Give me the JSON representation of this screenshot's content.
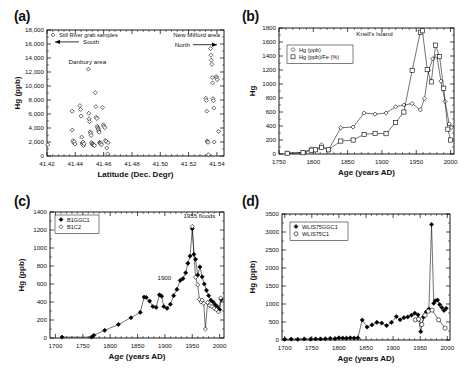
{
  "figure": {
    "panels": [
      "(a)",
      "(b)",
      "(c)",
      "(d)"
    ]
  },
  "chart_data": [
    {
      "panel": "(a)",
      "type": "scatter",
      "title": "",
      "xlabel": "Latitude (Dec. Degr)",
      "ylabel": "Hg (ppb)",
      "xlim": [
        41.42,
        41.545
      ],
      "ylim": [
        0,
        18000
      ],
      "xticks": [
        "41.42",
        "41.44",
        "41.46",
        "41.48",
        "41.50",
        "41.52",
        "41.54"
      ],
      "xtickvals": [
        41.42,
        41.44,
        41.46,
        41.48,
        41.5,
        41.52,
        41.54
      ],
      "yticks": [
        "0",
        "2,000",
        "4,000",
        "6,000",
        "8,000",
        "10,000",
        "12,000",
        "14,000",
        "16,000",
        "18,000"
      ],
      "ytickvals": [
        0,
        2000,
        4000,
        6000,
        8000,
        10000,
        12000,
        14000,
        16000,
        18000
      ],
      "legend": [
        {
          "label": "Still River grab samples",
          "marker": "open-diamond"
        }
      ],
      "annotations": [
        {
          "text": "South",
          "x": 41.443,
          "y": 16300,
          "arrow": "left"
        },
        {
          "text": "Danbury area",
          "x": 41.4485,
          "y": 13150
        },
        {
          "text": "New Milford area",
          "x": 41.5305,
          "y": 17000
        },
        {
          "text": "North",
          "x": 41.5285,
          "y": 15900,
          "arrow": "right"
        }
      ],
      "points": [
        [
          41.4205,
          1600
        ],
        [
          41.4378,
          6400
        ],
        [
          41.4378,
          3700
        ],
        [
          41.4383,
          2200
        ],
        [
          41.4388,
          1900
        ],
        [
          41.4392,
          2050
        ],
        [
          41.4398,
          1700
        ],
        [
          41.4432,
          7200
        ],
        [
          41.4436,
          6650
        ],
        [
          41.4441,
          5700
        ],
        [
          41.4445,
          2700
        ],
        [
          41.4448,
          1850
        ],
        [
          41.4452,
          1650
        ],
        [
          41.4455,
          2000
        ],
        [
          41.4458,
          1500
        ],
        [
          41.4462,
          1750
        ],
        [
          41.4492,
          12400
        ],
        [
          41.4495,
          6100
        ],
        [
          41.4498,
          5300
        ],
        [
          41.4501,
          4900
        ],
        [
          41.4505,
          3450
        ],
        [
          41.4508,
          3250
        ],
        [
          41.4512,
          2950
        ],
        [
          41.4515,
          1900
        ],
        [
          41.4518,
          1800
        ],
        [
          41.4521,
          1650
        ],
        [
          41.4525,
          1700
        ],
        [
          41.4528,
          1550
        ],
        [
          41.4532,
          1600
        ],
        [
          41.4535,
          1500
        ],
        [
          41.4541,
          9050
        ],
        [
          41.4545,
          7050
        ],
        [
          41.4548,
          5550
        ],
        [
          41.4552,
          5350
        ],
        [
          41.4555,
          4250
        ],
        [
          41.4558,
          4050
        ],
        [
          41.4561,
          3900
        ],
        [
          41.4564,
          3750
        ],
        [
          41.4566,
          3550
        ],
        [
          41.4569,
          3400
        ],
        [
          41.4572,
          1950
        ],
        [
          41.4575,
          1850
        ],
        [
          41.4578,
          1750
        ],
        [
          41.4581,
          1800
        ],
        [
          41.4584,
          1600
        ],
        [
          41.4592,
          6950
        ],
        [
          41.4598,
          4450
        ],
        [
          41.4602,
          4250
        ],
        [
          41.4608,
          4050
        ],
        [
          41.4612,
          2200
        ],
        [
          41.4618,
          2100
        ],
        [
          41.4622,
          1150
        ],
        [
          41.4628,
          300
        ],
        [
          41.4632,
          1900
        ],
        [
          41.5322,
          8250
        ],
        [
          41.5325,
          7950
        ],
        [
          41.5328,
          6400
        ],
        [
          41.5331,
          2150
        ],
        [
          41.5334,
          2000
        ],
        [
          41.5337,
          1950
        ],
        [
          41.5339,
          200
        ],
        [
          41.5355,
          15350
        ],
        [
          41.5358,
          14400
        ],
        [
          41.5361,
          13700
        ],
        [
          41.5364,
          13100
        ],
        [
          41.5367,
          11200
        ],
        [
          41.5369,
          10450
        ],
        [
          41.5372,
          8200
        ],
        [
          41.5375,
          7900
        ],
        [
          41.5378,
          6850
        ],
        [
          41.5381,
          2000
        ],
        [
          41.5395,
          11350
        ],
        [
          41.5398,
          11150
        ],
        [
          41.5402,
          10900
        ],
        [
          41.5412,
          3500
        ]
      ]
    },
    {
      "panel": "(b)",
      "type": "line",
      "title": "Knell's Island",
      "xlabel": "Age (years AD)",
      "ylabel": "Hg",
      "xlim": [
        1750,
        2005
      ],
      "ylim": [
        0,
        1800
      ],
      "xticks": [
        "1750",
        "1800",
        "1850",
        "1900",
        "1950",
        "2000"
      ],
      "xtickvals": [
        1750,
        1800,
        1850,
        1900,
        1950,
        2000
      ],
      "yticks": [
        "0",
        "200",
        "400",
        "600",
        "800",
        "1000",
        "1200",
        "1400",
        "1600",
        "1800"
      ],
      "ytickvals": [
        0,
        200,
        400,
        600,
        800,
        1000,
        1200,
        1400,
        1600,
        1800
      ],
      "legend": [
        {
          "label": "Hg  (ppb)",
          "marker": "open-diamond"
        },
        {
          "label": "Hg  (ppb)/Fe (%)",
          "marker": "open-square"
        }
      ],
      "series": [
        {
          "name": "Hg  (ppb)",
          "marker": "open-diamond",
          "x": [
            1762,
            1785,
            1797,
            1803,
            1812,
            1822,
            1840,
            1858,
            1874,
            1890,
            1906,
            1920,
            1932,
            1944,
            1956,
            1962,
            1968,
            1974,
            1980,
            1986,
            1992,
            1998,
            2001
          ],
          "y": [
            15,
            20,
            75,
            50,
            130,
            55,
            375,
            385,
            585,
            570,
            585,
            675,
            700,
            720,
            630,
            790,
            1195,
            1360,
            1400,
            1040,
            750,
            430,
            380
          ]
        },
        {
          "name": "Hg  (ppb)/Fe (%)",
          "marker": "open-square",
          "x": [
            1762,
            1785,
            1797,
            1803,
            1812,
            1822,
            1840,
            1858,
            1874,
            1890,
            1906,
            1920,
            1932,
            1944,
            1956,
            1959,
            1966,
            1972,
            1978,
            1984,
            1990,
            1996,
            2000
          ],
          "y": [
            10,
            18,
            55,
            60,
            95,
            60,
            185,
            200,
            280,
            295,
            290,
            450,
            600,
            1195,
            1740,
            1760,
            1205,
            1030,
            1555,
            1390,
            940,
            355,
            200
          ]
        }
      ]
    },
    {
      "panel": "(c)",
      "type": "line",
      "title": "",
      "xlabel": "Age (years AD)",
      "ylabel": "Hg (ppb)",
      "xlim": [
        1690,
        2008
      ],
      "ylim": [
        0,
        1400
      ],
      "xticks": [
        "1700",
        "1750",
        "1800",
        "1850",
        "1900",
        "1950",
        "2000"
      ],
      "xtickvals": [
        1700,
        1750,
        1800,
        1850,
        1900,
        1950,
        2000
      ],
      "yticks": [
        "0",
        "200",
        "400",
        "600",
        "800",
        "1000",
        "1200",
        "1400"
      ],
      "ytickvals": [
        0,
        200,
        400,
        600,
        800,
        1000,
        1200,
        1400
      ],
      "legend": [
        {
          "label": "B1GGC1",
          "marker": "filled-diamond"
        },
        {
          "label": "B1C2",
          "marker": "open-diamond"
        }
      ],
      "annotations": [
        {
          "text": "1955 floods",
          "x": 1963,
          "y": 1330
        },
        {
          "text": "1900",
          "x": 1899,
          "y": 650
        }
      ],
      "series": [
        {
          "name": "B1GGC1",
          "marker": "filled-diamond",
          "x": [
            1712,
            1766,
            1770,
            1790,
            1815,
            1838,
            1855,
            1862,
            1866,
            1872,
            1878,
            1884,
            1890,
            1894,
            1898,
            1904,
            1910,
            1916,
            1922,
            1928,
            1933,
            1938,
            1942,
            1946,
            1950,
            1953,
            1956,
            1960,
            1964,
            1968,
            1972,
            1976,
            1980,
            1984,
            1988,
            1992,
            1996,
            2000,
            2003
          ],
          "y": [
            10,
            10,
            30,
            85,
            150,
            225,
            285,
            455,
            450,
            410,
            350,
            340,
            480,
            465,
            350,
            330,
            375,
            470,
            540,
            640,
            660,
            725,
            830,
            910,
            1215,
            930,
            875,
            700,
            790,
            680,
            600,
            530,
            470,
            420,
            400,
            370,
            345,
            315,
            430
          ]
        },
        {
          "name": "B1C2",
          "marker": "open-diamond",
          "x": [
            1950,
            1956,
            1960,
            1963,
            1966,
            1968,
            1971,
            1974,
            1978,
            1982,
            1986,
            1990,
            1994,
            1998,
            2002
          ],
          "y": [
            1240,
            675,
            590,
            430,
            400,
            420,
            385,
            100,
            395,
            360,
            350,
            330,
            315,
            290,
            445
          ]
        }
      ]
    },
    {
      "panel": "(d)",
      "type": "line",
      "title": "",
      "xlabel": "Age (years AD)",
      "ylabel": "Hg (ppb)",
      "xlim": [
        1695,
        2005
      ],
      "ylim": [
        0,
        3500
      ],
      "xticks": [
        "1700",
        "1750",
        "1800",
        "1850",
        "1900",
        "1950",
        "2000"
      ],
      "xtickvals": [
        1700,
        1750,
        1800,
        1850,
        1900,
        1950,
        2000
      ],
      "yticks": [
        "0",
        "500",
        "1000",
        "1500",
        "2000",
        "2500",
        "3000",
        "3500"
      ],
      "ytickvals": [
        0,
        500,
        1000,
        1500,
        2000,
        2500,
        3000,
        3500
      ],
      "legend": [
        {
          "label": "WLIS75GGC1",
          "marker": "filled-diamond"
        },
        {
          "label": "WLIS75C1",
          "marker": "open-circle"
        }
      ],
      "series": [
        {
          "name": "WLIS75GGC1",
          "marker": "filled-diamond",
          "x": [
            1700,
            1712,
            1724,
            1736,
            1748,
            1757,
            1766,
            1775,
            1784,
            1793,
            1800,
            1807,
            1814,
            1821,
            1828,
            1835,
            1843,
            1852,
            1861,
            1870,
            1879,
            1888,
            1897,
            1906,
            1913,
            1920,
            1927,
            1934,
            1940,
            1946,
            1951,
            1956,
            1961,
            1966,
            1971,
            1975,
            1978,
            1982,
            1986,
            1990,
            1994,
            1998
          ],
          "y": [
            20,
            25,
            20,
            30,
            25,
            30,
            30,
            35,
            45,
            40,
            60,
            55,
            50,
            60,
            55,
            60,
            555,
            360,
            420,
            490,
            470,
            400,
            490,
            650,
            560,
            620,
            640,
            690,
            745,
            700,
            230,
            640,
            780,
            860,
            3210,
            1020,
            1090,
            1110,
            985,
            900,
            820,
            880
          ]
        },
        {
          "name": "WLIS75C1",
          "marker": "open-circle",
          "x": [
            1941,
            1947,
            1953,
            1959,
            1965,
            1972,
            1984,
            1996
          ],
          "y": [
            560,
            580,
            430,
            690,
            800,
            830,
            560,
            330
          ]
        }
      ]
    }
  ]
}
